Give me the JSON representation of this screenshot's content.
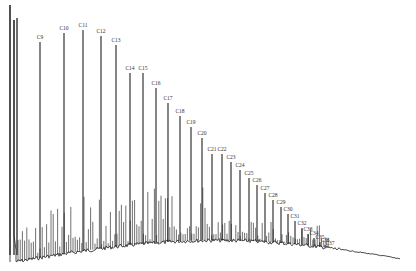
{
  "chart_data": {
    "type": "line",
    "title": "",
    "xlabel": "",
    "ylabel": "",
    "grid": false,
    "legend": null,
    "peaks": [
      {
        "label": "C9",
        "x": 40,
        "top": 42
      },
      {
        "label": "C10",
        "x": 64,
        "top": 33
      },
      {
        "label": "C11",
        "x": 83,
        "top": 30
      },
      {
        "label": "C12",
        "x": 101,
        "top": 36
      },
      {
        "label": "C13",
        "x": 116,
        "top": 45
      },
      {
        "label": "C14",
        "x": 130,
        "top": 73
      },
      {
        "label": "C15",
        "x": 143,
        "top": 73
      },
      {
        "label": "C16",
        "x": 156,
        "top": 88
      },
      {
        "label": "C17",
        "x": 168,
        "top": 103
      },
      {
        "label": "C18",
        "x": 180,
        "top": 116
      },
      {
        "label": "C19",
        "x": 191,
        "top": 127
      },
      {
        "label": "C20",
        "x": 202,
        "top": 138
      },
      {
        "label": "C21",
        "x": 212,
        "top": 154
      },
      {
        "label": "C22",
        "x": 222,
        "top": 154
      },
      {
        "label": "C23",
        "x": 231,
        "top": 162
      },
      {
        "label": "C24",
        "x": 240,
        "top": 170
      },
      {
        "label": "C25",
        "x": 249,
        "top": 178
      },
      {
        "label": "C26",
        "x": 257,
        "top": 185
      },
      {
        "label": "C27",
        "x": 265,
        "top": 193
      },
      {
        "label": "C28",
        "x": 273,
        "top": 200
      },
      {
        "label": "C29",
        "x": 281,
        "top": 207
      },
      {
        "label": "C30",
        "x": 288,
        "top": 214
      },
      {
        "label": "C31",
        "x": 295,
        "top": 221
      },
      {
        "label": "C32",
        "x": 302,
        "top": 228
      },
      {
        "label": "C33",
        "x": 308,
        "top": 234
      },
      {
        "label": "C34",
        "x": 314,
        "top": 238
      },
      {
        "label": "C35",
        "x": 320,
        "top": 242
      },
      {
        "label": "C36",
        "x": 325,
        "top": 245
      },
      {
        "label": "C37",
        "x": 330,
        "top": 248
      }
    ],
    "baseline": {
      "start_y": 262,
      "hump_peak_y": 238,
      "end_y": 262,
      "x_start": 14,
      "x_end": 400
    }
  }
}
